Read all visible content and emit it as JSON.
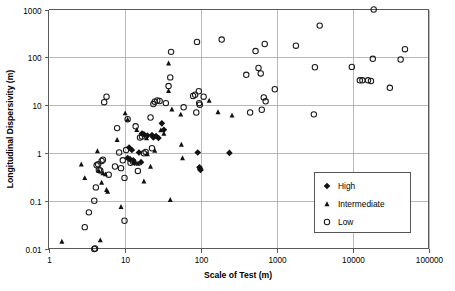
{
  "chart_data": {
    "type": "scatter",
    "title": "",
    "xlabel": "Scale of Test (m)",
    "ylabel": "Longitudinal Dispersivity (m)",
    "xscale": "log",
    "yscale": "log",
    "xlim": [
      1,
      100000
    ],
    "ylim": [
      0.01,
      1000
    ],
    "xticks": [
      "1",
      "10",
      "100",
      "1000",
      "10000",
      "100000"
    ],
    "yticks": [
      "1000",
      "100",
      "10",
      "1",
      "0.1",
      "0.01"
    ],
    "grid": true,
    "legend_position": "lower-right",
    "series": [
      {
        "name": "High",
        "marker": "filled-diamond",
        "color": "#111111",
        "points": [
          [
            11.5,
            1.3
          ],
          [
            12.5,
            1.15
          ],
          [
            11.0,
            0.78
          ],
          [
            11.8,
            0.74
          ],
          [
            13.0,
            0.7
          ],
          [
            13.5,
            0.62
          ],
          [
            15.5,
            1.02
          ],
          [
            16.5,
            0.64
          ],
          [
            17.0,
            2.55
          ],
          [
            18.0,
            2.45
          ],
          [
            20.0,
            2.3
          ],
          [
            23.0,
            2.35
          ],
          [
            24.0,
            2.1
          ],
          [
            26.0,
            2.25
          ],
          [
            28.0,
            2.05
          ],
          [
            31.0,
            4.15
          ],
          [
            33.0,
            3.05
          ],
          [
            92.0,
            1.02
          ],
          [
            97.0,
            0.5
          ],
          [
            99.0,
            0.46
          ],
          [
            100.0,
            0.44
          ],
          [
            240.0,
            1.0
          ]
        ]
      },
      {
        "name": "Intermediate",
        "marker": "filled-triangle",
        "color": "#111111",
        "points": [
          [
            1.5,
            0.014
          ],
          [
            2.7,
            0.58
          ],
          [
            3.0,
            0.3
          ],
          [
            4.4,
            1.1
          ],
          [
            4.6,
            0.42
          ],
          [
            4.8,
            0.015
          ],
          [
            5.0,
            0.24
          ],
          [
            5.2,
            0.38
          ],
          [
            5.6,
            0.36
          ],
          [
            5.8,
            0.17
          ],
          [
            6.0,
            0.155
          ],
          [
            8.0,
            1.88
          ],
          [
            9.0,
            0.075
          ],
          [
            10.2,
            6.8
          ],
          [
            11.0,
            5.0
          ],
          [
            14.5,
            3.05
          ],
          [
            15.0,
            0.6
          ],
          [
            17.0,
            2.55
          ],
          [
            18.0,
            0.255
          ],
          [
            19.5,
            2.05
          ],
          [
            20.0,
            0.95
          ],
          [
            22.0,
            0.52
          ],
          [
            25.0,
            1.12
          ],
          [
            30.0,
            3.0
          ],
          [
            33.0,
            2.55
          ],
          [
            38.0,
            75.0
          ],
          [
            38.0,
            20.0
          ],
          [
            40.0,
            0.105
          ],
          [
            42.0,
            8.2
          ],
          [
            55.0,
            6.4
          ],
          [
            56.0,
            1.5
          ],
          [
            58.0,
            0.78
          ],
          [
            130.0,
            12.5
          ],
          [
            170.0,
            7.2
          ],
          [
            260.0,
            6.1
          ]
        ]
      },
      {
        "name": "Low",
        "marker": "open-circle",
        "color": "#1a1a1a",
        "points": [
          [
            3.0,
            0.028
          ],
          [
            3.4,
            0.057
          ],
          [
            4.0,
            0.1
          ],
          [
            4.0,
            0.0098
          ],
          [
            4.1,
            0.01
          ],
          [
            4.2,
            0.19
          ],
          [
            4.3,
            0.55
          ],
          [
            4.5,
            0.58
          ],
          [
            4.6,
            0.44
          ],
          [
            4.8,
            0.43
          ],
          [
            5.0,
            0.68
          ],
          [
            5.2,
            0.72
          ],
          [
            5.4,
            11.5
          ],
          [
            5.8,
            15.0
          ],
          [
            6.2,
            0.35
          ],
          [
            7.5,
            0.52
          ],
          [
            8.0,
            3.3
          ],
          [
            8.5,
            1.02
          ],
          [
            9.0,
            0.48
          ],
          [
            9.5,
            0.7
          ],
          [
            10.0,
            0.038
          ],
          [
            10.0,
            0.3
          ],
          [
            10.5,
            1.15
          ],
          [
            11.0,
            5.05
          ],
          [
            12.0,
            0.62
          ],
          [
            13.0,
            0.65
          ],
          [
            14.0,
            3.6
          ],
          [
            15.0,
            0.42
          ],
          [
            16.0,
            2.1
          ],
          [
            17.0,
            2.2
          ],
          [
            18.0,
            0.98
          ],
          [
            19.0,
            1.05
          ],
          [
            22.0,
            5.5
          ],
          [
            23.0,
            1.25
          ],
          [
            24.0,
            10.5
          ],
          [
            25.0,
            11.8
          ],
          [
            27.0,
            12.5
          ],
          [
            29.0,
            12.2
          ],
          [
            35.0,
            11.0
          ],
          [
            38.0,
            25.0
          ],
          [
            40.0,
            38.0
          ],
          [
            41.0,
            130.0
          ],
          [
            60.0,
            9.0
          ],
          [
            80.0,
            15.5
          ],
          [
            85.0,
            16.5
          ],
          [
            88.0,
            7.0
          ],
          [
            90.0,
            210.0
          ],
          [
            95.0,
            19.5
          ],
          [
            96.0,
            11.0
          ],
          [
            98.0,
            10.2
          ],
          [
            110.0,
            15.0
          ],
          [
            190.0,
            235.0
          ],
          [
            400.0,
            43.0
          ],
          [
            450.0,
            7.0
          ],
          [
            530.0,
            135.0
          ],
          [
            580.0,
            60.0
          ],
          [
            620.0,
            46.0
          ],
          [
            640.0,
            8.0
          ],
          [
            680.0,
            14.5
          ],
          [
            700.0,
            190.0
          ],
          [
            720.0,
            12.0
          ],
          [
            950.0,
            21.5
          ],
          [
            1800.0,
            175.0
          ],
          [
            3100.0,
            6.4
          ],
          [
            3200.0,
            62.0
          ],
          [
            3700.0,
            460.0
          ],
          [
            9800.0,
            63.0
          ],
          [
            12500.0,
            33.0
          ],
          [
            13500.0,
            33.0
          ],
          [
            16000.0,
            33.0
          ],
          [
            17500.0,
            32.0
          ],
          [
            18500.0,
            93.0
          ],
          [
            19000.0,
            1000.0
          ],
          [
            31000.0,
            23.0
          ],
          [
            43000.0,
            90.0
          ],
          [
            49000.0,
            148.0
          ]
        ]
      }
    ]
  },
  "legend": {
    "entries": [
      {
        "label": "High",
        "marker": "filled-diamond"
      },
      {
        "label": "Intermediate",
        "marker": "filled-triangle"
      },
      {
        "label": "Low",
        "marker": "open-circle"
      }
    ]
  }
}
